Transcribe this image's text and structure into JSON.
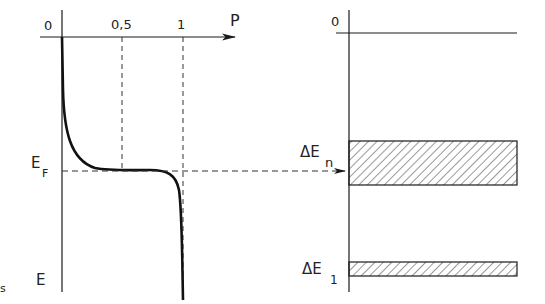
{
  "left_plot": {
    "x_axis_label": "P",
    "origin_label": "0",
    "tick_labels": [
      "0,5",
      "1"
    ],
    "y_axis_label": "E",
    "fermi_label": "E",
    "fermi_subscript": "F",
    "curve": "Fermi-Dirac distribution P(E), step from 1 to 0 around E_F"
  },
  "right_plot": {
    "origin_label": "0",
    "bands": [
      {
        "label": "ΔE",
        "subscript": "n",
        "description": "upper hatched energy band aligned with E_F"
      },
      {
        "label": "ΔE",
        "subscript": "1",
        "description": "lower hatched energy band"
      }
    ]
  },
  "corner_fragment": "s",
  "colors": {
    "line": "#1a1a1a",
    "dashed": "#333333",
    "background": "#ffffff"
  }
}
